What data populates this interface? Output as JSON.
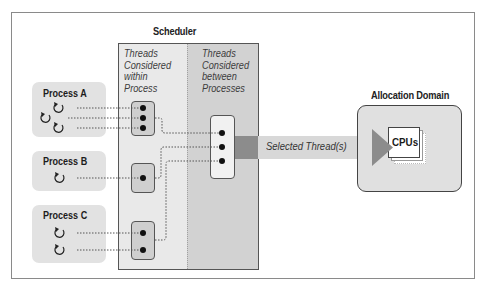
{
  "diagram": {
    "scheduler": {
      "title": "Scheduler",
      "columns": [
        {
          "label_lines": [
            "Threads",
            "Considered",
            "within",
            "Process"
          ]
        },
        {
          "label_lines": [
            "Threads",
            "Considered",
            "between",
            "Processes"
          ]
        }
      ]
    },
    "processes": [
      {
        "name": "Process A",
        "thread_count": 3
      },
      {
        "name": "Process B",
        "thread_count": 1
      },
      {
        "name": "Process C",
        "thread_count": 2
      }
    ],
    "flow": {
      "label": "Selected Thread(s)"
    },
    "allocation_domain": {
      "title": "Allocation Domain",
      "resource_label": "CPUs"
    },
    "icons": {
      "thread": "circular-arrow-icon",
      "thread_slot": "filled-dot-icon",
      "flow_arrow": "right-arrow-icon",
      "cpu_stack": "stacked-cards-icon"
    },
    "colors": {
      "frame_border": "#8a8a8a",
      "process_fill": "#e2e2e2",
      "scheduler_within_fill": "#e9e9e9",
      "scheduler_between_fill": "#d2d2d2",
      "group_fill": "#cfcfcf",
      "arrow_dark": "#8c8c8c",
      "arrow_band": "#d8d8d8",
      "domain_fill": "#e0e0e0"
    }
  }
}
